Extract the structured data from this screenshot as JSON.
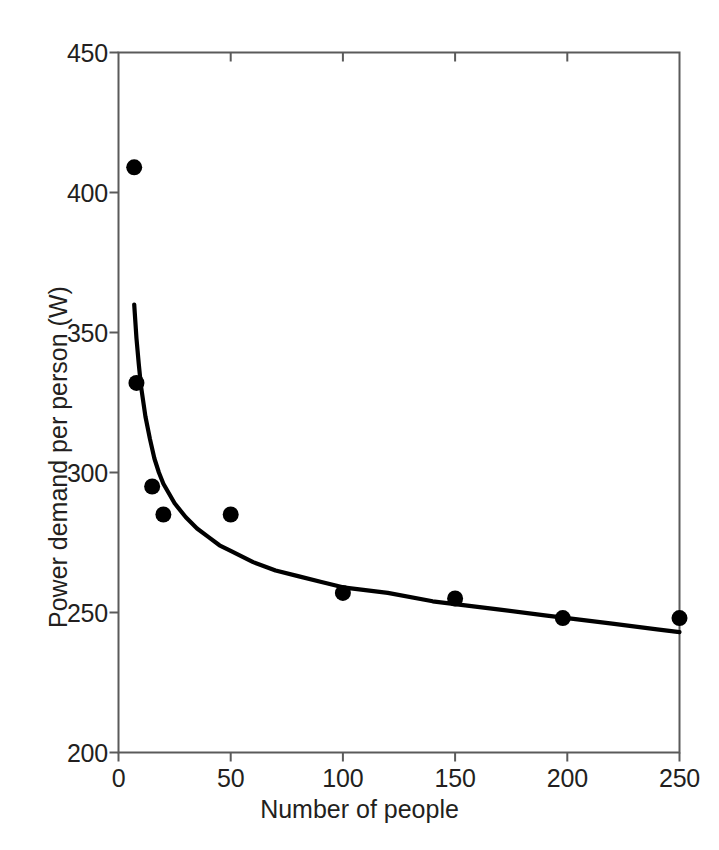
{
  "chart_data": {
    "type": "scatter",
    "title": "",
    "xlabel": "Number of people",
    "ylabel": "Power demand per person (W)",
    "xlim": [
      0,
      250
    ],
    "ylim": [
      200,
      450
    ],
    "xticks": [
      0,
      50,
      100,
      150,
      200,
      250
    ],
    "yticks": [
      200,
      250,
      300,
      350,
      400,
      450
    ],
    "xticklabels": [
      "0",
      "50",
      "100",
      "150",
      "200",
      "250"
    ],
    "yticklabels": [
      "200",
      "250",
      "300",
      "350",
      "400",
      "450"
    ],
    "grid": false,
    "legend": null,
    "marker": {
      "shape": "circle",
      "color": "#000000",
      "size_px": 16
    },
    "series": [
      {
        "name": "Measured power demand per person",
        "kind": "scatter",
        "color": "#000000",
        "points": [
          {
            "x": 7,
            "y": 409
          },
          {
            "x": 8,
            "y": 332
          },
          {
            "x": 15,
            "y": 295
          },
          {
            "x": 20,
            "y": 285
          },
          {
            "x": 50,
            "y": 285
          },
          {
            "x": 100,
            "y": 257
          },
          {
            "x": 150,
            "y": 255
          },
          {
            "x": 198,
            "y": 248
          },
          {
            "x": 250,
            "y": 248
          }
        ]
      },
      {
        "name": "Fitted trend curve",
        "kind": "line",
        "color": "#000000",
        "points": [
          {
            "x": 7,
            "y": 360
          },
          {
            "x": 8,
            "y": 348
          },
          {
            "x": 9,
            "y": 339
          },
          {
            "x": 10,
            "y": 331
          },
          {
            "x": 12,
            "y": 320
          },
          {
            "x": 14,
            "y": 312
          },
          {
            "x": 16,
            "y": 305
          },
          {
            "x": 18,
            "y": 300
          },
          {
            "x": 20,
            "y": 296
          },
          {
            "x": 25,
            "y": 289
          },
          {
            "x": 30,
            "y": 284
          },
          {
            "x": 35,
            "y": 280
          },
          {
            "x": 40,
            "y": 277
          },
          {
            "x": 45,
            "y": 274
          },
          {
            "x": 50,
            "y": 272
          },
          {
            "x": 60,
            "y": 268
          },
          {
            "x": 70,
            "y": 265
          },
          {
            "x": 80,
            "y": 263
          },
          {
            "x": 90,
            "y": 261
          },
          {
            "x": 100,
            "y": 259
          },
          {
            "x": 120,
            "y": 257
          },
          {
            "x": 140,
            "y": 254
          },
          {
            "x": 150,
            "y": 253
          },
          {
            "x": 170,
            "y": 251
          },
          {
            "x": 190,
            "y": 249
          },
          {
            "x": 200,
            "y": 248
          },
          {
            "x": 220,
            "y": 246
          },
          {
            "x": 240,
            "y": 244
          },
          {
            "x": 250,
            "y": 243
          }
        ]
      }
    ],
    "axes_style": {
      "frame": "box",
      "frame_color": "#5a5a5a",
      "bottom_ticks_direction": "out",
      "left_ticks_direction": "out",
      "top_ticks_direction": "in",
      "right_ticks_direction": "none"
    }
  }
}
